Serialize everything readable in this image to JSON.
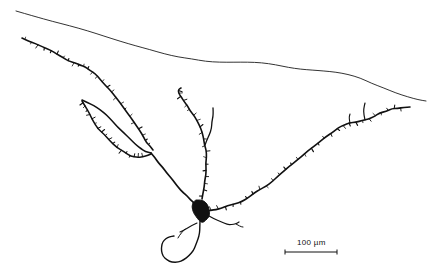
{
  "figure": {
    "type": "camera-lucida-neuron-tracing",
    "background_color": "#ffffff",
    "ink_color": "#111111",
    "contour_color": "#333333",
    "width_px": 442,
    "height_px": 277
  },
  "scale_bar": {
    "label": "100 µm",
    "value": 100,
    "unit": "µm",
    "bar_x_start_px": 285,
    "bar_x_end_px": 337,
    "bar_y_px": 252,
    "label_x_px": 297,
    "label_y_px": 238,
    "tick_height_px": 5,
    "stroke_width_px": 1
  },
  "chart_data": {
    "type": "line",
    "xlabel": "",
    "ylabel": "",
    "xlim": [
      0,
      442
    ],
    "ylim": [
      277,
      0
    ],
    "grid": false,
    "legend": "none",
    "annotations": [
      "100 µm"
    ],
    "series": [
      {
        "name": "tissue-surface-contour",
        "stroke": "#333333",
        "width": 1.0,
        "closed": false,
        "points": [
          [
            16,
            11
          ],
          [
            34,
            16
          ],
          [
            52,
            21
          ],
          [
            70,
            26
          ],
          [
            88,
            31
          ],
          [
            104,
            36
          ],
          [
            120,
            41
          ],
          [
            136,
            46
          ],
          [
            150,
            50
          ],
          [
            164,
            54
          ],
          [
            178,
            57
          ],
          [
            192,
            59
          ],
          [
            206,
            61
          ],
          [
            220,
            62
          ],
          [
            234,
            62
          ],
          [
            248,
            62
          ],
          [
            262,
            63
          ],
          [
            276,
            65
          ],
          [
            288,
            67
          ],
          [
            300,
            69
          ],
          [
            312,
            70
          ],
          [
            324,
            71
          ],
          [
            336,
            72
          ],
          [
            348,
            74
          ],
          [
            360,
            78
          ],
          [
            372,
            83
          ],
          [
            384,
            88
          ],
          [
            396,
            93
          ],
          [
            408,
            97
          ],
          [
            418,
            100
          ],
          [
            426,
            101
          ]
        ]
      },
      {
        "name": "soma",
        "stroke": "#111111",
        "fill": "#111111",
        "width": 1.0,
        "closed": true,
        "points": [
          [
            196,
            200
          ],
          [
            201,
            199
          ],
          [
            206,
            202
          ],
          [
            209,
            207
          ],
          [
            210,
            212
          ],
          [
            209,
            217
          ],
          [
            206,
            221
          ],
          [
            202,
            223
          ],
          [
            199,
            221
          ],
          [
            196,
            217
          ],
          [
            193,
            212
          ],
          [
            192,
            207
          ],
          [
            193,
            203
          ]
        ]
      },
      {
        "name": "left-primary-dendrite-upper",
        "stroke": "#111111",
        "width": 1.6,
        "closed": false,
        "points": [
          [
            22,
            38
          ],
          [
            29,
            41
          ],
          [
            36,
            44
          ],
          [
            43,
            47
          ],
          [
            50,
            50
          ],
          [
            57,
            54
          ],
          [
            63,
            58
          ],
          [
            69,
            61
          ],
          [
            75,
            63
          ],
          [
            80,
            65
          ],
          [
            85,
            67
          ],
          [
            90,
            70
          ],
          [
            95,
            74
          ],
          [
            100,
            79
          ],
          [
            105,
            85
          ],
          [
            110,
            91
          ],
          [
            115,
            97
          ],
          [
            120,
            103
          ],
          [
            125,
            110
          ],
          [
            130,
            117
          ],
          [
            135,
            124
          ],
          [
            140,
            131
          ],
          [
            144,
            137
          ],
          [
            147,
            142
          ],
          [
            150,
            146
          ],
          [
            153,
            150
          ]
        ]
      },
      {
        "name": "left-loop-upper-arc",
        "stroke": "#111111",
        "width": 1.5,
        "closed": false,
        "points": [
          [
            82,
            100
          ],
          [
            88,
            103
          ],
          [
            94,
            106
          ],
          [
            100,
            110
          ],
          [
            106,
            115
          ],
          [
            112,
            121
          ],
          [
            118,
            127
          ],
          [
            124,
            133
          ],
          [
            130,
            139
          ],
          [
            136,
            145
          ],
          [
            141,
            149
          ],
          [
            146,
            152
          ],
          [
            151,
            153
          ]
        ]
      },
      {
        "name": "left-loop-lower-arc",
        "stroke": "#111111",
        "width": 1.5,
        "closed": false,
        "points": [
          [
            82,
            101
          ],
          [
            85,
            107
          ],
          [
            89,
            114
          ],
          [
            93,
            121
          ],
          [
            98,
            128
          ],
          [
            104,
            135
          ],
          [
            110,
            141
          ],
          [
            117,
            147
          ],
          [
            124,
            152
          ],
          [
            131,
            156
          ],
          [
            138,
            158
          ],
          [
            145,
            157
          ],
          [
            151,
            154
          ]
        ]
      },
      {
        "name": "left-descending-to-soma",
        "stroke": "#111111",
        "width": 1.7,
        "closed": false,
        "points": [
          [
            151,
            153
          ],
          [
            155,
            158
          ],
          [
            159,
            163
          ],
          [
            163,
            168
          ],
          [
            167,
            173
          ],
          [
            171,
            178
          ],
          [
            175,
            183
          ],
          [
            179,
            188
          ],
          [
            183,
            192
          ],
          [
            187,
            196
          ],
          [
            191,
            200
          ],
          [
            194,
            203
          ]
        ]
      },
      {
        "name": "central-ascending-dendrite",
        "stroke": "#111111",
        "width": 1.6,
        "closed": false,
        "points": [
          [
            202,
            199
          ],
          [
            203,
            193
          ],
          [
            204,
            187
          ],
          [
            205,
            181
          ],
          [
            206,
            175
          ],
          [
            206,
            169
          ],
          [
            206,
            163
          ],
          [
            206,
            157
          ],
          [
            206,
            151
          ],
          [
            205,
            145
          ],
          [
            204,
            139
          ],
          [
            202,
            133
          ],
          [
            200,
            127
          ],
          [
            197,
            121
          ],
          [
            194,
            116
          ],
          [
            190,
            111
          ],
          [
            187,
            106
          ],
          [
            184,
            102
          ],
          [
            181,
            98
          ],
          [
            179,
            95
          ],
          [
            178,
            92
          ],
          [
            179,
            89
          ],
          [
            181,
            88
          ]
        ]
      },
      {
        "name": "central-secondary-branch",
        "stroke": "#111111",
        "width": 1.3,
        "closed": false,
        "points": [
          [
            205,
            145
          ],
          [
            207,
            140
          ],
          [
            209,
            134
          ],
          [
            211,
            128
          ],
          [
            212,
            122
          ],
          [
            213,
            117
          ],
          [
            213,
            112
          ],
          [
            213,
            108
          ]
        ]
      },
      {
        "name": "right-primary-dendrite",
        "stroke": "#111111",
        "width": 1.6,
        "closed": false,
        "points": [
          [
            207,
            211
          ],
          [
            214,
            210
          ],
          [
            221,
            208
          ],
          [
            228,
            206
          ],
          [
            235,
            204
          ],
          [
            242,
            201
          ],
          [
            248,
            198
          ],
          [
            254,
            194
          ],
          [
            260,
            190
          ],
          [
            266,
            186
          ],
          [
            272,
            181
          ],
          [
            278,
            176
          ],
          [
            284,
            171
          ],
          [
            290,
            166
          ],
          [
            296,
            161
          ],
          [
            302,
            156
          ],
          [
            308,
            151
          ],
          [
            314,
            146
          ],
          [
            320,
            141
          ],
          [
            326,
            136
          ],
          [
            332,
            132
          ],
          [
            338,
            128
          ],
          [
            344,
            125
          ],
          [
            350,
            123
          ],
          [
            356,
            122
          ],
          [
            362,
            121
          ],
          [
            368,
            119
          ],
          [
            374,
            116
          ],
          [
            380,
            113
          ],
          [
            386,
            111
          ],
          [
            392,
            109
          ],
          [
            398,
            108
          ],
          [
            404,
            107
          ],
          [
            410,
            107
          ]
        ]
      },
      {
        "name": "right-branch-spur-a",
        "stroke": "#111111",
        "width": 1.2,
        "closed": false,
        "points": [
          [
            365,
            120
          ],
          [
            364,
            114
          ],
          [
            364,
            108
          ],
          [
            365,
            103
          ]
        ]
      },
      {
        "name": "right-branch-spur-b",
        "stroke": "#111111",
        "width": 1.1,
        "closed": false,
        "points": [
          [
            350,
            123
          ],
          [
            349,
            118
          ],
          [
            350,
            114
          ]
        ]
      },
      {
        "name": "descending-axon",
        "stroke": "#111111",
        "width": 1.4,
        "closed": false,
        "points": [
          [
            200,
            221
          ],
          [
            200,
            227
          ],
          [
            199,
            233
          ],
          [
            198,
            239
          ],
          [
            196,
            245
          ],
          [
            193,
            251
          ],
          [
            189,
            256
          ],
          [
            184,
            260
          ],
          [
            178,
            262
          ],
          [
            172,
            262
          ],
          [
            167,
            260
          ],
          [
            163,
            256
          ],
          [
            161,
            251
          ],
          [
            161,
            246
          ],
          [
            163,
            242
          ],
          [
            166,
            239
          ],
          [
            170,
            237
          ],
          [
            174,
            236
          ]
        ]
      },
      {
        "name": "axon-collateral-left",
        "stroke": "#111111",
        "width": 1.1,
        "closed": false,
        "points": [
          [
            197,
            223
          ],
          [
            191,
            226
          ],
          [
            185,
            229
          ],
          [
            180,
            232
          ]
        ]
      },
      {
        "name": "axon-collateral-fork",
        "stroke": "#111111",
        "width": 1.0,
        "closed": false,
        "points": [
          [
            185,
            229
          ],
          [
            181,
            234
          ],
          [
            178,
            238
          ]
        ]
      },
      {
        "name": "soma-lateral-process",
        "stroke": "#111111",
        "width": 1.2,
        "closed": false,
        "points": [
          [
            209,
            216
          ],
          [
            215,
            219
          ],
          [
            221,
            222
          ],
          [
            227,
            224
          ],
          [
            232,
            225
          ],
          [
            236,
            224
          ],
          [
            239,
            222
          ]
        ]
      },
      {
        "name": "soma-lateral-tip",
        "stroke": "#111111",
        "width": 1.0,
        "closed": false,
        "points": [
          [
            236,
            224
          ],
          [
            240,
            226
          ],
          [
            243,
            227
          ]
        ]
      }
    ],
    "spine_clusters": [
      {
        "name": "left-upper-spines",
        "along": "left-primary-dendrite-upper",
        "count": 26
      },
      {
        "name": "left-loop-spines",
        "along": "left-loop-lower-arc",
        "count": 18
      },
      {
        "name": "central-spines",
        "along": "central-ascending-dendrite",
        "count": 20
      },
      {
        "name": "right-spines",
        "along": "right-primary-dendrite",
        "count": 30
      }
    ]
  }
}
